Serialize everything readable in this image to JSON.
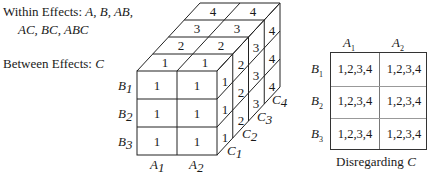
{
  "left_text": {
    "within_label": "Within Effects:",
    "within_line1": "A, B, AB,",
    "within_line2": "AC, BC, ABC",
    "between_label": "Between Effects:",
    "between_value": "C"
  },
  "cube": {
    "front_face": [
      [
        "1",
        "1"
      ],
      [
        "1",
        "1"
      ],
      [
        "1",
        "1"
      ]
    ],
    "top_face": [
      [
        "1",
        "1"
      ],
      [
        "2",
        "2"
      ],
      [
        "3",
        "3"
      ],
      [
        "4",
        "4"
      ]
    ],
    "right_face": [
      [
        "1",
        "2",
        "3",
        "4"
      ],
      [
        "1",
        "2",
        "3",
        "4"
      ],
      [
        "1",
        "2",
        "3",
        "4"
      ]
    ],
    "row_labels": [
      "B1",
      "B2",
      "B3"
    ],
    "col_labels": [
      "A1",
      "A2"
    ],
    "depth_labels": [
      "C1",
      "C2",
      "C3",
      "C4"
    ],
    "row_letter": "B",
    "col_letter": "A",
    "depth_letter": "C",
    "row_subs": [
      "1",
      "2",
      "3"
    ],
    "col_subs": [
      "1",
      "2"
    ],
    "depth_subs": [
      "1",
      "2",
      "3",
      "4"
    ]
  },
  "table": {
    "col_headers": [
      {
        "letter": "A",
        "sub": "1"
      },
      {
        "letter": "A",
        "sub": "2"
      }
    ],
    "row_headers": [
      {
        "letter": "B",
        "sub": "1"
      },
      {
        "letter": "B",
        "sub": "2"
      },
      {
        "letter": "B",
        "sub": "3"
      }
    ],
    "cells": [
      [
        "1,2,3,4",
        "1,2,3,4"
      ],
      [
        "1,2,3,4",
        "1,2,3,4"
      ],
      [
        "1,2,3,4",
        "1,2,3,4"
      ]
    ],
    "caption": "Disregarding",
    "caption_var": "C"
  }
}
